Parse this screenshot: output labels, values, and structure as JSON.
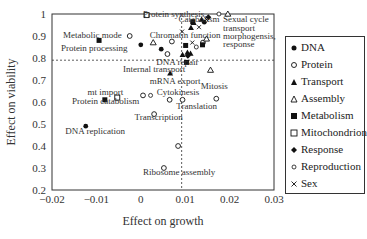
{
  "chart_data": {
    "type": "scatter",
    "title": "",
    "xlabel": "Effect on growth",
    "ylabel": "Effect on viability",
    "xlim": [
      -0.02,
      0.03
    ],
    "ylim": [
      0.2,
      1.0
    ],
    "xticks": [
      -0.02,
      -0.01,
      0,
      0.01,
      0.02,
      0.03
    ],
    "xtick_labels": [
      "−0.02",
      "−0.01",
      "0",
      "0.01",
      "0.02",
      "0.03"
    ],
    "yticks": [
      0.2,
      0.3,
      0.4,
      0.5,
      0.6,
      0.7,
      0.8,
      0.9,
      1.0
    ],
    "ytick_labels": [
      "0.2",
      "0.3",
      "0.4",
      "0.5",
      "0.6",
      "0.7",
      "0.8",
      "0.9",
      "1"
    ],
    "reference_lines": {
      "horizontal_y": 0.79,
      "vertical_x": 0.0092
    },
    "grid": false,
    "legend_position": "right",
    "series": [
      {
        "name": "DNA",
        "marker": "filled-circle",
        "points": [
          [
            -0.0124,
            0.49
          ],
          [
            0.0,
            0.86
          ],
          [
            0.0046,
            0.84
          ],
          [
            0.0143,
            0.963
          ]
        ]
      },
      {
        "name": "Protein",
        "marker": "open-circle",
        "points": [
          [
            -0.0025,
            0.9
          ],
          [
            0.0005,
            0.63
          ],
          [
            0.003,
            0.545
          ],
          [
            0.0065,
            0.61
          ],
          [
            0.0094,
            0.61
          ],
          [
            0.0084,
            0.4
          ],
          [
            0.0052,
            0.3
          ],
          [
            0.007,
            0.875
          ],
          [
            0.014,
            0.87
          ],
          [
            0.017,
            0.615
          ],
          [
            0.006,
            0.818
          ]
        ]
      },
      {
        "name": "Transport",
        "marker": "filled-triangle",
        "points": [
          [
            0.0094,
            0.815
          ],
          [
            0.0112,
            0.82
          ],
          [
            0.0105,
            0.825
          ],
          [
            0.0113,
            0.937
          ],
          [
            0.0119,
            0.96
          ],
          [
            0.0137,
            0.975
          ],
          [
            0.0066,
            0.73
          ]
        ]
      },
      {
        "name": "Assembly",
        "marker": "open-triangle",
        "points": [
          [
            0.0028,
            0.87
          ],
          [
            0.0148,
            0.887
          ],
          [
            0.0157,
            0.745
          ],
          [
            0.0196,
            1.0
          ]
        ]
      },
      {
        "name": "Metabolism",
        "marker": "filled-square",
        "points": [
          [
            -0.0094,
            0.88
          ],
          [
            -0.0081,
            0.61
          ],
          [
            0.0101,
            0.857
          ],
          [
            0.0117,
            0.965
          ],
          [
            0.0139,
            0.86
          ],
          [
            0.0103,
            0.78
          ]
        ]
      },
      {
        "name": "Mitochondrion",
        "marker": "open-square",
        "points": [
          [
            0.0013,
            0.995
          ],
          [
            -0.0053,
            0.62
          ]
        ]
      },
      {
        "name": "Response",
        "marker": "filled-diamond",
        "points": [
          [
            0.0152,
            0.985
          ],
          [
            0.0106,
            0.81
          ]
        ]
      },
      {
        "name": "Reproduction",
        "marker": "small-open-circle",
        "points": [
          [
            0.0176,
            1.0
          ],
          [
            0.0125,
            0.85
          ],
          [
            0.0022,
            0.63
          ]
        ]
      },
      {
        "name": "Sex",
        "marker": "x",
        "points": [
          [
            0.0093,
            0.92
          ],
          [
            0.0116,
            0.87
          ],
          [
            0.0131,
            0.94
          ],
          [
            0.0148,
            0.975
          ]
        ]
      }
    ],
    "annotations": [
      {
        "text": "Protein synthesis",
        "x": 0.0005,
        "y": 0.985
      },
      {
        "text": "Catabolism",
        "x": 0.0085,
        "y": 0.965
      },
      {
        "text": "Sexual cycle",
        "x": 0.0185,
        "y": 0.962
      },
      {
        "text": "transport",
        "x": 0.0185,
        "y": 0.925
      },
      {
        "text": "morphogensis,",
        "x": 0.0185,
        "y": 0.888
      },
      {
        "text": "response",
        "x": 0.0185,
        "y": 0.851
      },
      {
        "text": "Metabolic mode",
        "x": -0.0175,
        "y": 0.89
      },
      {
        "text": "Chromatin function",
        "x": 0.002,
        "y": 0.89
      },
      {
        "text": "Protein processing",
        "x": -0.018,
        "y": 0.83
      },
      {
        "text": "DNA repair",
        "x": 0.0035,
        "y": 0.77
      },
      {
        "text": "Internal transport",
        "x": -0.004,
        "y": 0.735
      },
      {
        "text": "mRNA export",
        "x": 0.002,
        "y": 0.68
      },
      {
        "text": "mt import",
        "x": -0.012,
        "y": 0.63
      },
      {
        "text": "Cytokinesis",
        "x": 0.0036,
        "y": 0.63
      },
      {
        "text": "Mitosis",
        "x": 0.0135,
        "y": 0.66
      },
      {
        "text": "Protein catabolism",
        "x": -0.0155,
        "y": 0.59
      },
      {
        "text": "Translation",
        "x": 0.008,
        "y": 0.57
      },
      {
        "text": "Transcription",
        "x": -0.0014,
        "y": 0.52
      },
      {
        "text": "DNA replication",
        "x": -0.017,
        "y": 0.455
      },
      {
        "text": "Ribosome assembly",
        "x": 0.0005,
        "y": 0.27
      }
    ]
  },
  "legend": {
    "items": [
      {
        "label": "DNA",
        "marker": "filled-circle"
      },
      {
        "label": "Protein",
        "marker": "open-circle"
      },
      {
        "label": "Transport",
        "marker": "filled-triangle"
      },
      {
        "label": "Assembly",
        "marker": "open-triangle"
      },
      {
        "label": "Metabolism",
        "marker": "filled-square"
      },
      {
        "label": "Mitochondrion",
        "marker": "open-square"
      },
      {
        "label": "Response",
        "marker": "filled-diamond"
      },
      {
        "label": "Reproduction",
        "marker": "small-open-circle"
      },
      {
        "label": "Sex",
        "marker": "x"
      }
    ]
  },
  "axes": {
    "xlabel": "Effect on growth",
    "ylabel": "Effect on viability"
  }
}
